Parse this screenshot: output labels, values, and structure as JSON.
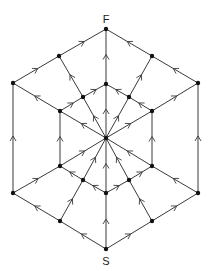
{
  "diagram": {
    "type": "directed-graph",
    "labels": {
      "source": "S",
      "sink": "F"
    },
    "nodes": [
      {
        "id": "F"
      },
      {
        "id": "S"
      },
      {
        "id": "C"
      },
      {
        "id": "TL"
      },
      {
        "id": "TR"
      },
      {
        "id": "OL1"
      },
      {
        "id": "OR1"
      },
      {
        "id": "OL2"
      },
      {
        "id": "OR2"
      },
      {
        "id": "BL"
      },
      {
        "id": "BR"
      },
      {
        "id": "IT"
      },
      {
        "id": "IUL"
      },
      {
        "id": "IUR"
      },
      {
        "id": "ML1"
      },
      {
        "id": "MR1"
      },
      {
        "id": "ML2"
      },
      {
        "id": "MR2"
      },
      {
        "id": "ILL"
      },
      {
        "id": "ILR"
      },
      {
        "id": "IB"
      }
    ],
    "edges": [
      [
        "S",
        "BL"
      ],
      [
        "BL",
        "OL2"
      ],
      [
        "OL2",
        "OL1"
      ],
      [
        "OL1",
        "TL"
      ],
      [
        "TL",
        "F"
      ],
      [
        "S",
        "BR"
      ],
      [
        "BR",
        "OR2"
      ],
      [
        "OR2",
        "OR1"
      ],
      [
        "OR1",
        "TR"
      ],
      [
        "TR",
        "F"
      ],
      [
        "S",
        "IB"
      ],
      [
        "IB",
        "C"
      ],
      [
        "C",
        "IT"
      ],
      [
        "IT",
        "F"
      ],
      [
        "BL",
        "ILL"
      ],
      [
        "ILL",
        "C"
      ],
      [
        "BR",
        "ILR"
      ],
      [
        "ILR",
        "C"
      ],
      [
        "OL2",
        "ML2"
      ],
      [
        "ML2",
        "C"
      ],
      [
        "OR2",
        "MR2"
      ],
      [
        "MR2",
        "C"
      ],
      [
        "IB",
        "ILL"
      ],
      [
        "ILL",
        "ML2"
      ],
      [
        "IB",
        "ILR"
      ],
      [
        "ILR",
        "MR2"
      ],
      [
        "ML2",
        "ML1"
      ],
      [
        "MR2",
        "MR1"
      ],
      [
        "C",
        "ML1"
      ],
      [
        "ML1",
        "OL1"
      ],
      [
        "C",
        "MR1"
      ],
      [
        "MR1",
        "OR1"
      ],
      [
        "C",
        "IUL"
      ],
      [
        "IUL",
        "TL"
      ],
      [
        "C",
        "IUR"
      ],
      [
        "IUR",
        "TR"
      ],
      [
        "ML1",
        "IUL"
      ],
      [
        "IUL",
        "IT"
      ],
      [
        "MR1",
        "IUR"
      ],
      [
        "IUR",
        "IT"
      ]
    ]
  }
}
